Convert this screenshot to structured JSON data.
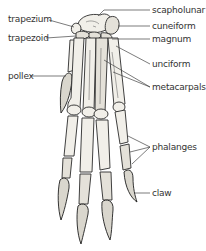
{
  "diagram": {
    "labels": {
      "trapezium": "trapezium",
      "trapezoid": "trapezoid",
      "pollex": "pollex",
      "scapholunar": "scapholunar",
      "cuneiform": "cuneiform",
      "magnum": "magnum",
      "unciform": "unciform",
      "metacarpals": "metacarpals",
      "phalanges": "phalanges",
      "claw": "claw"
    }
  }
}
